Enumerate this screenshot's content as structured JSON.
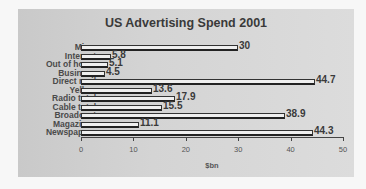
{
  "chart_data": {
    "type": "bar",
    "orientation": "horizontal",
    "title": "US Advertising Spend 2001",
    "xlabel": "$bn",
    "ylabel": "",
    "xlim": [
      0,
      50
    ],
    "xticks": [
      0,
      10,
      20,
      30,
      40,
      50
    ],
    "grid": false,
    "legend": null,
    "categories": [
      "Misc.",
      "Internet",
      "Out of home",
      "Business",
      "Direct mail",
      "Yellow",
      "Radio total",
      "Cable total",
      "Broadcast",
      "Magazines",
      "Newspapers"
    ],
    "values": [
      30,
      5.8,
      5.1,
      4.5,
      44.7,
      13.6,
      17.9,
      15.5,
      38.9,
      11.1,
      44.3
    ],
    "value_labels": [
      "30",
      "5.8",
      "5.1",
      "4.5",
      "44.7",
      "13.6",
      "17.9",
      "15.5",
      "38.9",
      "11.1",
      "44.3"
    ]
  },
  "tick_labels": [
    "0",
    "10",
    "20",
    "30",
    "40",
    "50"
  ]
}
